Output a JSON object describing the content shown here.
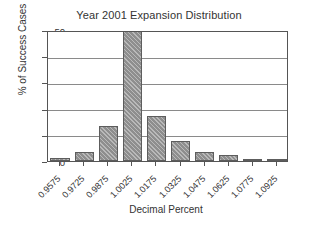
{
  "chart_data": {
    "type": "bar",
    "title": "Year 2001 Expansion Distribution",
    "xlabel": "Decimal Percent",
    "ylabel": "% of Success Cases",
    "categories": [
      "0.9575",
      "0.9725",
      "0.9875",
      "1.0025",
      "1.0175",
      "1.0325",
      "1.0475",
      "1.0625",
      "1.0775",
      "1.0925"
    ],
    "values": [
      1.3,
      3.5,
      13.5,
      50.0,
      17.2,
      7.6,
      3.3,
      2.3,
      0.7,
      0.2
    ],
    "ylim": [
      0,
      50
    ],
    "yticks": [
      "0",
      "10",
      "20",
      "30",
      "40",
      "50"
    ],
    "ytick_values": [
      0,
      10,
      20,
      30,
      40,
      50
    ],
    "grid": true,
    "legend": "none",
    "bar_color": "#8e8e8e",
    "bar_edge_color": "#5d5d5d",
    "axis_color": "#555555",
    "text_color": "#333333",
    "background": "#ffffff",
    "note": "Tallest bar at 1.0025 is clipped at the axis maximum of 50"
  }
}
